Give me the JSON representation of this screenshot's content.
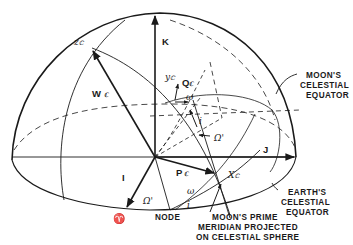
{
  "figure": {
    "type": "celestial-sphere-diagram",
    "axes": {
      "K": "K",
      "J": "J",
      "I": "I"
    },
    "vectors": {
      "W": "W",
      "W_sub": "ℂ",
      "P": "P",
      "P_sub": "ℂ",
      "Q": "Q",
      "Q_sub": "ℂ",
      "x": "X",
      "x_sub": "ℂ",
      "y": "y",
      "y_sub": "ℂ",
      "z": "z",
      "z_sub": "ℂ"
    },
    "angles": {
      "omega_lower": "ω",
      "omega_upper": "ω",
      "i_lower": "i",
      "i_upper": "i",
      "node_long_lower": "Ω'",
      "node_long_upper": "Ω'"
    },
    "symbols": {
      "vernal_equinox": "♈"
    },
    "labels": {
      "node": "NODE",
      "moon_equator": [
        "MOON'S",
        "CELESTIAL",
        "EQUATOR"
      ],
      "earth_equator": [
        "EARTH'S",
        "CELESTIAL",
        "EQUATOR"
      ],
      "prime_meridian": [
        "MOON'S PRIME",
        "MERIDIAN PROJECTED",
        "ON CELESTIAL SPHERE"
      ]
    }
  }
}
